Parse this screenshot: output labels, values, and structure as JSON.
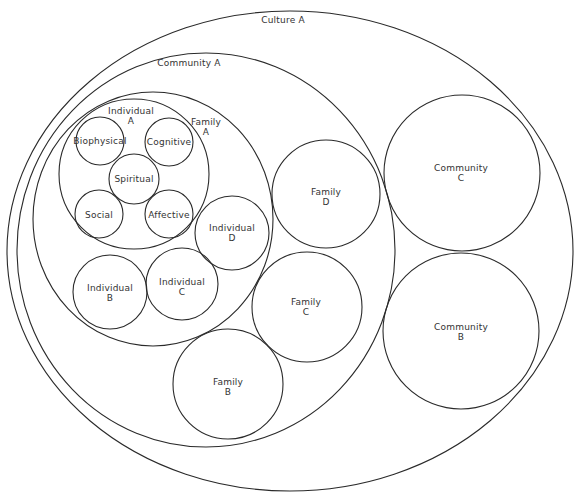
{
  "diagram": {
    "stroke_color": "#2a2a2a",
    "text_color": "#333333",
    "background": "#ffffff",
    "nodes": {
      "culture_a": {
        "line1": "Culture A",
        "line2": ""
      },
      "community_a": {
        "line1": "Community A",
        "line2": ""
      },
      "community_b": {
        "line1": "Community",
        "line2": "B"
      },
      "community_c": {
        "line1": "Community",
        "line2": "C"
      },
      "family_a": {
        "line1": "Family",
        "line2": "A"
      },
      "family_b": {
        "line1": "Family",
        "line2": "B"
      },
      "family_c": {
        "line1": "Family",
        "line2": "C"
      },
      "family_d": {
        "line1": "Family",
        "line2": "D"
      },
      "individual_a": {
        "line1": "Individual",
        "line2": "A"
      },
      "individual_b": {
        "line1": "Individual",
        "line2": "B"
      },
      "individual_c": {
        "line1": "Individual",
        "line2": "C"
      },
      "individual_d": {
        "line1": "Individual",
        "line2": "D"
      },
      "biophysical": {
        "line1": "Biophysical"
      },
      "cognitive": {
        "line1": "Cognitive"
      },
      "spiritual": {
        "line1": "Spiritual"
      },
      "social": {
        "line1": "Social"
      },
      "affective": {
        "line1": "Affective"
      }
    }
  }
}
